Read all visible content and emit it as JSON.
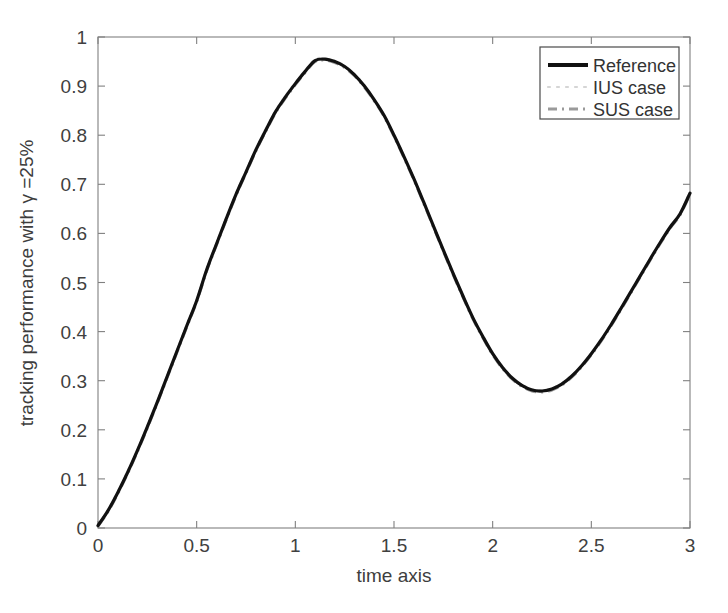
{
  "chart_data": {
    "type": "line",
    "title": "",
    "xlabel": "time axis",
    "ylabel": "tracking performance with γ =25%",
    "xlim": [
      0,
      3
    ],
    "ylim": [
      0,
      1
    ],
    "xticks": [
      0,
      0.5,
      1,
      1.5,
      2,
      2.5,
      3
    ],
    "xticklabels": [
      "0",
      "0.5",
      "1",
      "1.5",
      "2",
      "2.5",
      "3"
    ],
    "yticks": [
      0,
      0.1,
      0.2,
      0.3,
      0.4,
      0.5,
      0.6,
      0.7,
      0.8,
      0.9,
      1
    ],
    "yticklabels": [
      "0",
      "0.1",
      "0.2",
      "0.3",
      "0.4",
      "0.5",
      "0.6",
      "0.7",
      "0.8",
      "0.9",
      "1"
    ],
    "grid": false,
    "box": true,
    "legend_position": "top-right",
    "legend_entries": [
      {
        "name": "Reference",
        "style": "solid",
        "color": "#111111",
        "width": 3.2
      },
      {
        "name": "IUS case",
        "style": "dotted",
        "color": "#d8d8d8",
        "width": 2.0
      },
      {
        "name": "SUS case",
        "style": "dash-dot",
        "color": "#9a9a9a",
        "width": 3.0
      }
    ],
    "x": [
      0,
      0.05,
      0.1,
      0.15,
      0.2,
      0.25,
      0.3,
      0.35,
      0.4,
      0.45,
      0.5,
      0.55,
      0.6,
      0.65,
      0.7,
      0.75,
      0.8,
      0.85,
      0.9,
      0.95,
      1,
      1.05,
      1.1,
      1.15,
      1.2,
      1.25,
      1.3,
      1.35,
      1.4,
      1.45,
      1.5,
      1.55,
      1.6,
      1.65,
      1.7,
      1.75,
      1.8,
      1.85,
      1.9,
      1.95,
      2,
      2.05,
      2.1,
      2.15,
      2.2,
      2.25,
      2.3,
      2.35,
      2.4,
      2.45,
      2.5,
      2.55,
      2.6,
      2.65,
      2.7,
      2.75,
      2.8,
      2.85,
      2.9,
      2.95,
      3
    ],
    "series": [
      {
        "name": "Reference",
        "values": [
          0.005,
          0.035,
          0.072,
          0.113,
          0.158,
          0.206,
          0.256,
          0.308,
          0.36,
          0.412,
          0.463,
          0.525,
          0.578,
          0.63,
          0.68,
          0.725,
          0.77,
          0.81,
          0.848,
          0.878,
          0.905,
          0.93,
          0.952,
          0.955,
          0.95,
          0.94,
          0.923,
          0.9,
          0.872,
          0.84,
          0.8,
          0.757,
          0.712,
          0.664,
          0.615,
          0.566,
          0.518,
          0.472,
          0.428,
          0.39,
          0.355,
          0.327,
          0.305,
          0.29,
          0.281,
          0.279,
          0.283,
          0.293,
          0.309,
          0.33,
          0.355,
          0.383,
          0.414,
          0.447,
          0.481,
          0.515,
          0.549,
          0.582,
          0.613,
          0.64,
          0.682
        ]
      },
      {
        "name": "IUS case",
        "values": [
          0.006,
          0.037,
          0.075,
          0.116,
          0.16,
          0.209,
          0.259,
          0.311,
          0.363,
          0.415,
          0.466,
          0.528,
          0.581,
          0.633,
          0.683,
          0.728,
          0.773,
          0.813,
          0.851,
          0.881,
          0.908,
          0.933,
          0.955,
          0.957,
          0.952,
          0.942,
          0.925,
          0.902,
          0.874,
          0.842,
          0.802,
          0.759,
          0.714,
          0.666,
          0.617,
          0.568,
          0.52,
          0.474,
          0.43,
          0.392,
          0.357,
          0.329,
          0.307,
          0.292,
          0.283,
          0.281,
          0.285,
          0.295,
          0.311,
          0.332,
          0.357,
          0.385,
          0.416,
          0.449,
          0.483,
          0.517,
          0.551,
          0.584,
          0.615,
          0.642,
          0.686
        ]
      },
      {
        "name": "SUS case",
        "values": [
          0.004,
          0.033,
          0.07,
          0.111,
          0.156,
          0.204,
          0.254,
          0.306,
          0.358,
          0.41,
          0.461,
          0.523,
          0.576,
          0.628,
          0.678,
          0.723,
          0.768,
          0.808,
          0.846,
          0.876,
          0.903,
          0.928,
          0.95,
          0.953,
          0.948,
          0.938,
          0.921,
          0.898,
          0.87,
          0.838,
          0.798,
          0.755,
          0.71,
          0.662,
          0.613,
          0.564,
          0.516,
          0.47,
          0.426,
          0.388,
          0.353,
          0.325,
          0.303,
          0.288,
          0.279,
          0.277,
          0.281,
          0.291,
          0.307,
          0.328,
          0.353,
          0.381,
          0.412,
          0.445,
          0.479,
          0.513,
          0.547,
          0.58,
          0.611,
          0.638,
          0.68
        ]
      }
    ]
  }
}
